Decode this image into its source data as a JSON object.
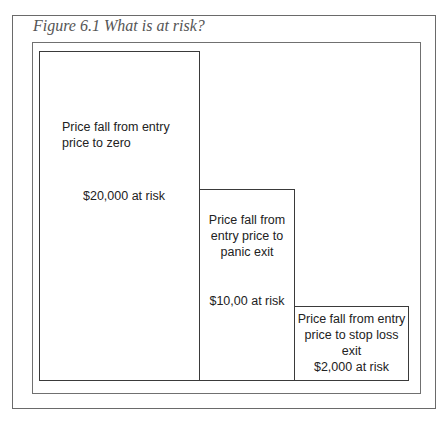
{
  "figure": {
    "title": "Figure 6.1 What is at risk?"
  },
  "boxes": [
    {
      "description": "Price fall from entry price to zero",
      "risk": "$20,000 at risk",
      "amount_at_risk": 20000
    },
    {
      "description": "Price fall from entry price to panic exit",
      "risk": "$10,00 at risk",
      "amount_at_risk": 10000
    },
    {
      "description": "Price fall from entry price to stop loss exit",
      "risk": "$2,000 at risk",
      "amount_at_risk": 2000
    }
  ]
}
